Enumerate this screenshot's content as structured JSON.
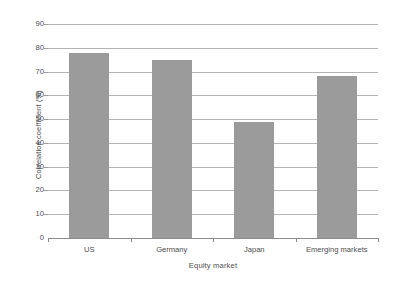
{
  "chart_data": {
    "type": "bar",
    "title": "",
    "xlabel": "Equity market",
    "ylabel": "Correlation coefficient (%)",
    "categories": [
      "US",
      "Germany",
      "Japan",
      "Emerging markets"
    ],
    "values": [
      78,
      75,
      49,
      68
    ],
    "series": [
      {
        "name": "Correlation coefficient",
        "values": [
          78,
          75,
          49,
          68
        ]
      }
    ],
    "ylim": [
      0,
      90
    ],
    "yticks": [
      0,
      10,
      20,
      30,
      40,
      50,
      60,
      70,
      80,
      90
    ],
    "ytick_labels": [
      "0",
      "10",
      "20",
      "30",
      "40",
      "50",
      "60",
      "70",
      "80",
      "90"
    ],
    "grid": true,
    "grid_axis": "y",
    "legend": false,
    "legend_position": "none",
    "bar_color": "#9b9b9b",
    "gridline_color": "#b4b4b4",
    "axis_color": "#8c8c8c",
    "background_color": "#ffffff",
    "text_color": "#4d4d4d"
  }
}
